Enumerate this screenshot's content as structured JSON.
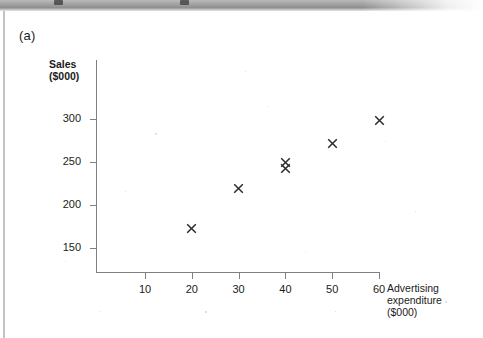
{
  "figure": {
    "label": "(a)"
  },
  "chart_data": {
    "type": "scatter",
    "title": "",
    "xlabel": "Advertising expenditure ($000)",
    "ylabel": "Sales ($000)",
    "xlabel_lines": [
      "Advertising",
      "expenditure",
      "($000)"
    ],
    "ylabel_lines": [
      "Sales",
      "($000)"
    ],
    "xlim": [
      0,
      65
    ],
    "ylim": [
      135,
      315
    ],
    "grid": false,
    "legend": null,
    "marker": "x",
    "marker_color": "#2b2b2b",
    "xticks": [
      10,
      20,
      30,
      40,
      50,
      60
    ],
    "xtick_labels": [
      "10",
      "20",
      "30",
      "40",
      "50",
      "60"
    ],
    "yticks": [
      150,
      200,
      250,
      300
    ],
    "ytick_labels": [
      "150",
      "200",
      "250",
      "300"
    ],
    "points": [
      {
        "x": 20,
        "y": 173
      },
      {
        "x": 30,
        "y": 219
      },
      {
        "x": 40,
        "y": 250
      },
      {
        "x": 40,
        "y": 242
      },
      {
        "x": 50,
        "y": 271
      },
      {
        "x": 60,
        "y": 298
      }
    ]
  },
  "colors": {
    "axis": "#808080",
    "text": "#1b1b1b",
    "background": "#ffffff",
    "scan_band": "#9e9e9e"
  }
}
